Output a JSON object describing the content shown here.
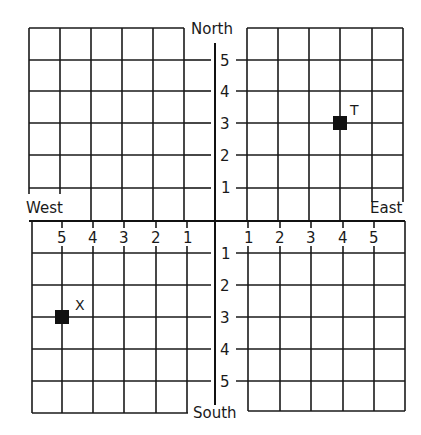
{
  "diagram": {
    "type": "coordinate-grid",
    "directions": {
      "north": "North",
      "south": "South",
      "west": "West",
      "east": "East"
    },
    "north_ticks": [
      "5",
      "4",
      "3",
      "2",
      "1"
    ],
    "south_ticks": [
      "1",
      "2",
      "3",
      "4",
      "5"
    ],
    "west_ticks": [
      "5",
      "4",
      "3",
      "2",
      "1"
    ],
    "east_ticks": [
      "1",
      "2",
      "3",
      "4",
      "5"
    ],
    "points": [
      {
        "label": "T",
        "east": 4,
        "north": 3,
        "color": "#111111"
      },
      {
        "label": "X",
        "west": 5,
        "south": 3,
        "color": "#111111"
      }
    ]
  }
}
